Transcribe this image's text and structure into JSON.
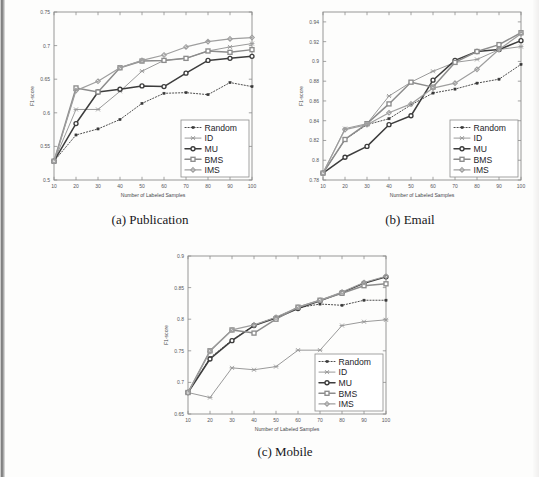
{
  "figure": {
    "kind": "scanned-paper-figure",
    "panel_captions": [
      "(a) Publication",
      "(b) Email",
      "(c) Mobile"
    ]
  },
  "series_style": {
    "Random": {
      "color": "#3a3a3a",
      "dash": "1.2,1.8",
      "marker": "square",
      "width": 0.9
    },
    "ID": {
      "color": "#9a9a9a",
      "dash": "none",
      "marker": "asterisk",
      "width": 1.0
    },
    "MU": {
      "color": "#3d3d3d",
      "dash": "none",
      "marker": "circle",
      "width": 1.5
    },
    "BMS": {
      "color": "#8c8c8c",
      "dash": "none",
      "marker": "square",
      "width": 1.5
    },
    "IMS": {
      "color": "#9e9e9e",
      "dash": "none",
      "marker": "diamond",
      "width": 1.2
    }
  },
  "legend": {
    "entries": [
      "Random",
      "ID",
      "MU",
      "BMS",
      "IMS"
    ]
  },
  "chart_data": [
    {
      "id": "publication",
      "type": "line",
      "title": "(a) Publication",
      "xlabel": "Number of Labeled Samples",
      "ylabel": "F1-score",
      "x": [
        10,
        20,
        30,
        40,
        50,
        60,
        70,
        80,
        90,
        100
      ],
      "xlim": [
        10,
        100
      ],
      "ylim": [
        0.5,
        0.75
      ],
      "yticks": [
        0.5,
        0.55,
        0.6,
        0.65,
        0.7,
        0.75
      ],
      "ytick_labels": [
        "0.5",
        "0.55",
        "0.6",
        "0.65",
        "0.7",
        "0.75"
      ],
      "xticks": [
        10,
        20,
        30,
        40,
        50,
        60,
        70,
        80,
        90,
        100
      ],
      "xtick_labels": [
        "10",
        "20",
        "30",
        "40",
        "50",
        "60",
        "70",
        "80",
        "90",
        "100"
      ],
      "grid": false,
      "legend_position": "lower-right",
      "series": [
        {
          "name": "Random",
          "values": [
            0.528,
            0.567,
            0.576,
            0.59,
            0.614,
            0.629,
            0.63,
            0.627,
            0.645,
            0.639
          ]
        },
        {
          "name": "ID",
          "values": [
            0.528,
            0.605,
            0.605,
            0.632,
            0.662,
            0.678,
            0.681,
            0.692,
            0.698,
            0.703
          ]
        },
        {
          "name": "MU",
          "values": [
            0.528,
            0.584,
            0.631,
            0.635,
            0.64,
            0.639,
            0.659,
            0.678,
            0.681,
            0.684
          ]
        },
        {
          "name": "BMS",
          "values": [
            0.528,
            0.637,
            0.631,
            0.667,
            0.677,
            0.678,
            0.681,
            0.692,
            0.69,
            0.694
          ]
        },
        {
          "name": "IMS",
          "values": [
            0.528,
            0.633,
            0.647,
            0.667,
            0.678,
            0.686,
            0.698,
            0.706,
            0.71,
            0.712
          ]
        }
      ]
    },
    {
      "id": "email",
      "type": "line",
      "title": "(b) Email",
      "xlabel": "Number of Labeled Samples",
      "ylabel": "F1-score",
      "x": [
        10,
        20,
        30,
        40,
        50,
        60,
        70,
        80,
        90,
        100
      ],
      "xlim": [
        10,
        100
      ],
      "ylim": [
        0.78,
        0.95
      ],
      "yticks": [
        0.78,
        0.8,
        0.82,
        0.84,
        0.86,
        0.88,
        0.9,
        0.92,
        0.94
      ],
      "ytick_labels": [
        "0.78",
        "0.8",
        "0.82",
        "0.84",
        "0.86",
        "0.88",
        "0.9",
        "0.92",
        "0.94"
      ],
      "xticks": [
        10,
        20,
        30,
        40,
        50,
        60,
        70,
        80,
        90,
        100
      ],
      "xtick_labels": [
        "10",
        "20",
        "30",
        "40",
        "50",
        "60",
        "70",
        "80",
        "90",
        "100"
      ],
      "grid": false,
      "legend_position": "lower-right",
      "series": [
        {
          "name": "Random",
          "values": [
            0.787,
            0.821,
            0.836,
            0.842,
            0.856,
            0.868,
            0.872,
            0.878,
            0.882,
            0.897
          ]
        },
        {
          "name": "ID",
          "values": [
            0.787,
            0.832,
            0.837,
            0.865,
            0.879,
            0.89,
            0.899,
            0.902,
            0.912,
            0.915
          ]
        },
        {
          "name": "MU",
          "values": [
            0.787,
            0.803,
            0.814,
            0.836,
            0.845,
            0.881,
            0.901,
            0.91,
            0.912,
            0.921
          ]
        },
        {
          "name": "BMS",
          "values": [
            0.787,
            0.821,
            0.837,
            0.857,
            0.879,
            0.874,
            0.899,
            0.91,
            0.917,
            0.929
          ]
        },
        {
          "name": "IMS",
          "values": [
            0.787,
            0.831,
            0.836,
            0.848,
            0.857,
            0.873,
            0.878,
            0.892,
            0.912,
            0.928
          ]
        }
      ]
    },
    {
      "id": "mobile",
      "type": "line",
      "title": "(c) Mobile",
      "xlabel": "Number of Labeled Samples",
      "ylabel": "F1-score",
      "x": [
        10,
        20,
        30,
        40,
        50,
        60,
        70,
        80,
        90,
        100
      ],
      "xlim": [
        10,
        100
      ],
      "ylim": [
        0.65,
        0.9
      ],
      "yticks": [
        0.65,
        0.7,
        0.75,
        0.8,
        0.85,
        0.9
      ],
      "ytick_labels": [
        "0.65",
        "0.7",
        "0.75",
        "0.8",
        "0.85",
        "0.9"
      ],
      "xticks": [
        10,
        20,
        30,
        40,
        50,
        60,
        70,
        80,
        90,
        100
      ],
      "xtick_labels": [
        "10",
        "20",
        "30",
        "40",
        "50",
        "60",
        "70",
        "80",
        "90",
        "100"
      ],
      "grid": false,
      "legend_position": "lower-right",
      "series": [
        {
          "name": "Random",
          "values": [
            0.684,
            0.739,
            0.767,
            0.79,
            0.803,
            0.818,
            0.824,
            0.822,
            0.83,
            0.83
          ]
        },
        {
          "name": "ID",
          "values": [
            0.684,
            0.676,
            0.723,
            0.72,
            0.725,
            0.751,
            0.751,
            0.79,
            0.796,
            0.799
          ]
        },
        {
          "name": "MU",
          "values": [
            0.684,
            0.737,
            0.766,
            0.79,
            0.802,
            0.817,
            0.829,
            0.842,
            0.857,
            0.867
          ]
        },
        {
          "name": "BMS",
          "values": [
            0.684,
            0.75,
            0.783,
            0.778,
            0.8,
            0.819,
            0.83,
            0.841,
            0.853,
            0.856
          ]
        },
        {
          "name": "IMS",
          "values": [
            0.684,
            0.749,
            0.783,
            0.791,
            0.803,
            0.819,
            0.83,
            0.843,
            0.858,
            0.868
          ]
        }
      ]
    }
  ]
}
